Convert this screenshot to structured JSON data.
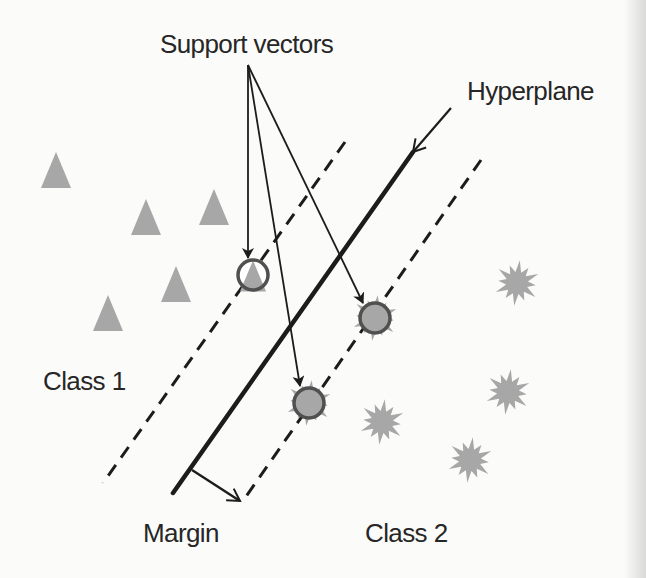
{
  "diagram": {
    "colors": {
      "background": "#fbfbfa",
      "point_fill": "#a7a7a7",
      "sv_stroke": "#505050",
      "line": "#1c1c1c",
      "text": "#262626"
    },
    "labels": {
      "support_vectors": {
        "text": "Support vectors",
        "x": 160,
        "y": 53,
        "size": 26
      },
      "hyperplane": {
        "text": "Hyperplane",
        "x": 467,
        "y": 100,
        "size": 26
      },
      "class1": {
        "text": "Class 1",
        "x": 43,
        "y": 390,
        "size": 26
      },
      "margin": {
        "text": "Margin",
        "x": 143,
        "y": 542,
        "size": 26
      },
      "class2": {
        "text": "Class 2",
        "x": 365,
        "y": 542,
        "size": 26
      }
    },
    "lines": {
      "hyperplane": {
        "x1": 413,
        "y1": 152,
        "x2": 173,
        "y2": 493
      },
      "margin_left": {
        "x1": 345,
        "y1": 142,
        "x2": 103,
        "y2": 483
      },
      "margin_right": {
        "x1": 481,
        "y1": 160,
        "x2": 245,
        "y2": 498
      }
    },
    "arrows": {
      "hyperplane_pointer": {
        "x1": 451,
        "y1": 108,
        "x2": 413,
        "y2": 152
      },
      "margin_pointer": {
        "x1": 192,
        "y1": 470,
        "x2": 240,
        "y2": 501
      },
      "support_vector_pointers": [
        {
          "x1": 248,
          "y1": 65,
          "x2": 248,
          "y2": 258
        },
        {
          "x1": 248,
          "y1": 65,
          "x2": 300,
          "y2": 386
        },
        {
          "x1": 248,
          "y1": 65,
          "x2": 363,
          "y2": 303
        }
      ]
    },
    "class1_points": [
      {
        "x": 56,
        "y": 170
      },
      {
        "x": 146,
        "y": 217
      },
      {
        "x": 214,
        "y": 207
      },
      {
        "x": 176,
        "y": 284
      },
      {
        "x": 108,
        "y": 313
      }
    ],
    "class2_points": [
      {
        "x": 517,
        "y": 283
      },
      {
        "x": 508,
        "y": 392
      },
      {
        "x": 382,
        "y": 422
      },
      {
        "x": 470,
        "y": 460
      }
    ],
    "support_vectors": [
      {
        "x": 253,
        "y": 275,
        "class": 1
      },
      {
        "x": 375,
        "y": 318,
        "class": 2
      },
      {
        "x": 309,
        "y": 403,
        "class": 2
      }
    ]
  }
}
